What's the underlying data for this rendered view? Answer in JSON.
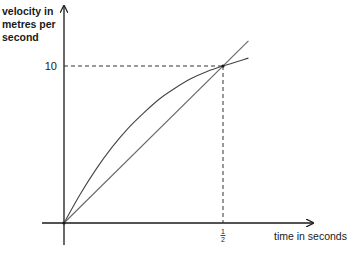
{
  "chart_data": {
    "type": "line",
    "title": "",
    "xlabel": "time in seconds",
    "ylabel_lines": [
      "velocity in",
      "metres per",
      "second"
    ],
    "xlim": [
      0,
      0.6
    ],
    "ylim": [
      0,
      13.7
    ],
    "x_ticks": [
      {
        "value": 0.5,
        "label_num": "1",
        "label_den": "2"
      }
    ],
    "y_ticks": [
      {
        "value": 10,
        "label": "10"
      }
    ],
    "grid": false,
    "legend": null,
    "series": [
      {
        "name": "curve (velocity-time)",
        "style": "curve",
        "x": [
          0,
          0.05,
          0.1,
          0.15,
          0.2,
          0.25,
          0.3,
          0.35,
          0.4,
          0.45,
          0.5,
          0.58
        ],
        "y": [
          0,
          1.8,
          3.4,
          4.8,
          6.0,
          7.0,
          7.9,
          8.6,
          9.2,
          9.65,
          10,
          10.5
        ]
      },
      {
        "name": "straight line (constant acceleration)",
        "style": "line",
        "x": [
          0,
          0.58
        ],
        "y": [
          0,
          11.6
        ]
      }
    ],
    "annotations": [
      {
        "type": "dashed-guide",
        "x": 0.5,
        "y": 10,
        "description": "dashed lines from point (1/2, 10) to both axes"
      }
    ]
  }
}
